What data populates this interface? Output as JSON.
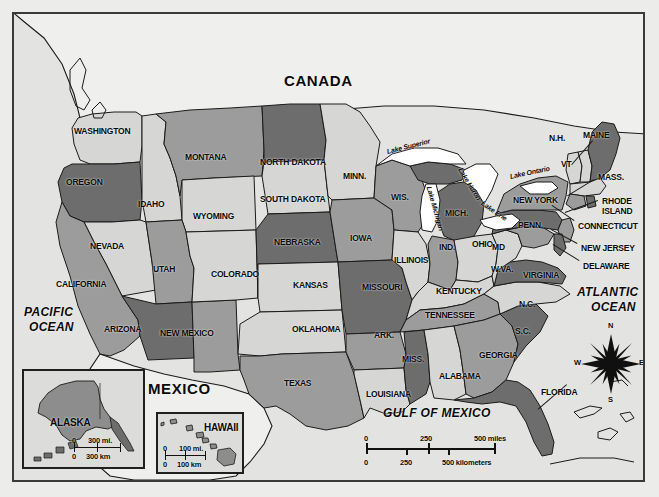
{
  "map": {
    "title": "United States political map",
    "countries": [
      {
        "name": "CANADA",
        "x": 282,
        "y": 70
      },
      {
        "name": "MEXICO",
        "x": 146,
        "y": 378
      }
    ],
    "oceans": [
      {
        "name": "PACIFIC",
        "x": 22,
        "y": 303
      },
      {
        "name": "OCEAN",
        "x": 27,
        "y": 318
      },
      {
        "name": "ATLANTIC",
        "x": 575,
        "y": 283
      },
      {
        "name": "OCEAN",
        "x": 589,
        "y": 298
      },
      {
        "name": "GULF OF MEXICO",
        "x": 381,
        "y": 404
      }
    ],
    "lakes": [
      {
        "name": "Lake Superior",
        "x": 385,
        "y": 146,
        "rot": -14
      },
      {
        "name": "Lake Michigan",
        "x": 427,
        "y": 181,
        "rot": 74
      },
      {
        "name": "Lake Huron",
        "x": 458,
        "y": 163,
        "rot": 58
      },
      {
        "name": "Lake Erie",
        "x": 480,
        "y": 197,
        "rot": 34
      },
      {
        "name": "Lake Ontario",
        "x": 508,
        "y": 171,
        "rot": -12
      }
    ],
    "states": [
      {
        "name": "WASHINGTON",
        "x": 72,
        "y": 124,
        "size": "sm",
        "shade": "light"
      },
      {
        "name": "OREGON",
        "x": 64,
        "y": 175,
        "size": "sm",
        "shade": "dark"
      },
      {
        "name": "IDAHO",
        "x": 136,
        "y": 197,
        "size": "sm",
        "shade": "light"
      },
      {
        "name": "MONTANA",
        "x": 183,
        "y": 150,
        "size": "sm",
        "shade": "mid"
      },
      {
        "name": "WYOMING",
        "x": 191,
        "y": 209,
        "size": "sm",
        "shade": "light"
      },
      {
        "name": "NEVADA",
        "x": 88,
        "y": 239,
        "size": "sm",
        "shade": "light"
      },
      {
        "name": "UTAH",
        "x": 151,
        "y": 262,
        "size": "sm",
        "shade": "mid"
      },
      {
        "name": "CALIFORNIA",
        "x": 54,
        "y": 277,
        "size": "sm",
        "shade": "mid"
      },
      {
        "name": "ARIZONA",
        "x": 102,
        "y": 322,
        "size": "sm",
        "shade": "dark"
      },
      {
        "name": "NEW MEXICO",
        "x": 158,
        "y": 326,
        "size": "sm",
        "shade": "mid"
      },
      {
        "name": "COLORADO",
        "x": 209,
        "y": 267,
        "size": "sm",
        "shade": "light"
      },
      {
        "name": "NORTH DAKOTA",
        "x": 258,
        "y": 155,
        "size": "sm",
        "shade": "dark"
      },
      {
        "name": "SOUTH DAKOTA",
        "x": 258,
        "y": 192,
        "size": "sm",
        "shade": "light"
      },
      {
        "name": "NEBRASKA",
        "x": 272,
        "y": 235,
        "size": "sm",
        "shade": "dark"
      },
      {
        "name": "KANSAS",
        "x": 291,
        "y": 278,
        "size": "sm",
        "shade": "light"
      },
      {
        "name": "OKLAHOMA",
        "x": 290,
        "y": 322,
        "size": "sm",
        "shade": "light"
      },
      {
        "name": "TEXAS",
        "x": 282,
        "y": 376,
        "size": "sm",
        "shade": "mid"
      },
      {
        "name": "MINN.",
        "x": 341,
        "y": 169,
        "size": "sm",
        "shade": "light"
      },
      {
        "name": "IOWA",
        "x": 348,
        "y": 231,
        "size": "sm",
        "shade": "mid"
      },
      {
        "name": "MISSOURI",
        "x": 360,
        "y": 280,
        "size": "sm",
        "shade": "dark"
      },
      {
        "name": "ARK.",
        "x": 372,
        "y": 328,
        "size": "sm",
        "shade": "mid"
      },
      {
        "name": "LOUISIANA",
        "x": 364,
        "y": 387,
        "size": "sm",
        "shade": "light"
      },
      {
        "name": "WIS.",
        "x": 389,
        "y": 190,
        "size": "sm",
        "shade": "mid"
      },
      {
        "name": "ILLINOIS",
        "x": 392,
        "y": 253,
        "size": "sm",
        "shade": "light"
      },
      {
        "name": "MICH.",
        "x": 443,
        "y": 206,
        "size": "sm",
        "shade": "dark"
      },
      {
        "name": "IND.",
        "x": 437,
        "y": 240,
        "size": "sm",
        "shade": "mid"
      },
      {
        "name": "OHIO",
        "x": 470,
        "y": 237,
        "size": "sm",
        "shade": "light"
      },
      {
        "name": "KENTUCKY",
        "x": 434,
        "y": 284,
        "size": "sm",
        "shade": "light"
      },
      {
        "name": "TENNESSEE",
        "x": 423,
        "y": 308,
        "size": "sm",
        "shade": "mid"
      },
      {
        "name": "MISS.",
        "x": 400,
        "y": 352,
        "size": "sm",
        "shade": "dark"
      },
      {
        "name": "ALABAMA",
        "x": 437,
        "y": 369,
        "size": "sm",
        "shade": "light"
      },
      {
        "name": "GEORGIA",
        "x": 477,
        "y": 348,
        "size": "sm",
        "shade": "mid"
      },
      {
        "name": "S.C.",
        "x": 513,
        "y": 324,
        "size": "sm",
        "shade": "dark"
      },
      {
        "name": "N.C.",
        "x": 517,
        "y": 297,
        "size": "sm",
        "shade": "light"
      },
      {
        "name": "FLORIDA",
        "x": 539,
        "y": 385,
        "size": "sm",
        "shade": "dark"
      },
      {
        "name": "VIRGINIA",
        "x": 521,
        "y": 268,
        "size": "sm",
        "shade": "dark"
      },
      {
        "name": "W.VA.",
        "x": 489,
        "y": 262,
        "size": "sm",
        "shade": "light"
      },
      {
        "name": "MD",
        "x": 490,
        "y": 240,
        "size": "sm",
        "shade": "mid"
      },
      {
        "name": "PENN.",
        "x": 516,
        "y": 218,
        "size": "sm",
        "shade": "dark"
      },
      {
        "name": "NEW YORK",
        "x": 511,
        "y": 193,
        "size": "sm",
        "shade": "mid"
      },
      {
        "name": "VT",
        "x": 559,
        "y": 157,
        "size": "sm",
        "shade": "light"
      },
      {
        "name": "N.H.",
        "x": 547,
        "y": 131,
        "size": "sm",
        "shade": "light"
      },
      {
        "name": "MAINE",
        "x": 581,
        "y": 128,
        "size": "sm",
        "shade": "dark"
      },
      {
        "name": "MASS.",
        "x": 596,
        "y": 170,
        "size": "sm",
        "shade": "light"
      },
      {
        "name": "RHODE",
        "x": 600,
        "y": 194,
        "size": "sm",
        "shade": "none"
      },
      {
        "name": "ISLAND",
        "x": 600,
        "y": 204,
        "size": "sm",
        "shade": "none"
      },
      {
        "name": "CONNECTICUT",
        "x": 576,
        "y": 219,
        "size": "sm",
        "shade": "none"
      },
      {
        "name": "NEW JERSEY",
        "x": 579,
        "y": 241,
        "size": "sm",
        "shade": "none"
      },
      {
        "name": "DELAWARE",
        "x": 581,
        "y": 259,
        "size": "sm",
        "shade": "none"
      }
    ],
    "leaders": [
      {
        "x1": 591,
        "y1": 139,
        "x2": 570,
        "y2": 163
      },
      {
        "x1": 592,
        "y1": 178,
        "x2": 566,
        "y2": 194
      },
      {
        "x1": 596,
        "y1": 199,
        "x2": 563,
        "y2": 211
      },
      {
        "x1": 572,
        "y1": 219,
        "x2": 550,
        "y2": 204
      },
      {
        "x1": 575,
        "y1": 242,
        "x2": 549,
        "y2": 228
      },
      {
        "x1": 577,
        "y1": 259,
        "x2": 551,
        "y2": 243
      },
      {
        "x1": 565,
        "y1": 383,
        "x2": 536,
        "y2": 408
      }
    ],
    "compass": {
      "n": "N",
      "s": "S",
      "e": "E",
      "w": "W",
      "cx": 597,
      "cy": 350
    },
    "scale": {
      "miles": {
        "ticks": [
          "0",
          "250",
          "500 miles"
        ]
      },
      "kilometers": {
        "ticks": [
          "0",
          "250",
          "500 kilometers"
        ]
      }
    },
    "insets": [
      {
        "title": "ALASKA",
        "scale_mi": [
          "0",
          "300 mi."
        ],
        "scale_km": [
          "0",
          "300 km"
        ]
      },
      {
        "title": "HAWAII",
        "scale_mi": [
          "0",
          "100 mi."
        ],
        "scale_km": [
          "0",
          "100 km"
        ]
      }
    ],
    "colors": {
      "dark": "#6d6d6d",
      "mid": "#9c9c9c",
      "light": "#d6d6d4",
      "water": "#ffffff",
      "land_foreign": "#efefee",
      "ink": "#1a1a1a",
      "page": "#e9e9e7"
    }
  }
}
